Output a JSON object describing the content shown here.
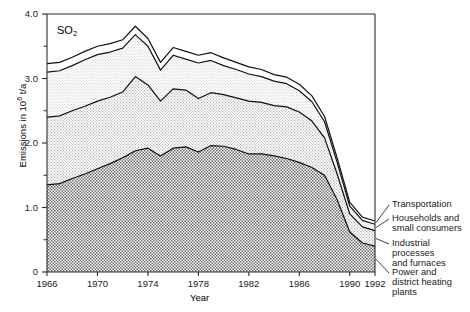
{
  "chart_data": {
    "type": "area",
    "title": "",
    "series_label": "SO2",
    "xlabel": "Year",
    "ylabel_prefix": "Emissions in 10",
    "ylabel_exp": "6",
    "ylabel_suffix": " t/a",
    "xlim": [
      1966,
      1992
    ],
    "ylim": [
      0,
      4.0
    ],
    "grid": false,
    "legend_position": "right-inline",
    "ytick_labels": [
      "4.0",
      "3.0",
      "2.0",
      "1.0",
      "0"
    ],
    "ytick_values": [
      4.0,
      3.0,
      2.0,
      1.0,
      0
    ],
    "yminor_values": [
      3.5,
      2.5,
      1.5,
      0.5
    ],
    "xtick_labels": [
      "1966",
      "1970",
      "1974",
      "1978",
      "1982",
      "1986",
      "1990",
      "1992"
    ],
    "xtick_values": [
      1966,
      1970,
      1974,
      1978,
      1982,
      1986,
      1990,
      1992
    ],
    "x": [
      1966,
      1967,
      1968,
      1969,
      1970,
      1971,
      1972,
      1973,
      1974,
      1975,
      1976,
      1977,
      1978,
      1979,
      1980,
      1981,
      1982,
      1983,
      1984,
      1985,
      1986,
      1987,
      1988,
      1989,
      1990,
      1991,
      1992
    ],
    "stack_order": "bottom-to-top",
    "series": [
      {
        "name": "Power and district heating plants",
        "key": "power",
        "fill": "dark-checker",
        "values": [
          1.35,
          1.37,
          1.45,
          1.52,
          1.6,
          1.68,
          1.77,
          1.88,
          1.92,
          1.8,
          1.92,
          1.94,
          1.86,
          1.96,
          1.95,
          1.9,
          1.83,
          1.83,
          1.8,
          1.76,
          1.7,
          1.62,
          1.5,
          1.12,
          0.62,
          0.45,
          0.4
        ]
      },
      {
        "name": "Industrial processes and furnaces",
        "key": "industry",
        "fill": "medium-dot",
        "values": [
          1.05,
          1.05,
          1.05,
          1.05,
          1.05,
          1.03,
          1.02,
          1.15,
          0.98,
          0.85,
          0.92,
          0.88,
          0.83,
          0.82,
          0.8,
          0.8,
          0.82,
          0.8,
          0.78,
          0.8,
          0.78,
          0.72,
          0.58,
          0.4,
          0.28,
          0.25,
          0.24
        ]
      },
      {
        "name": "Households and small consumers",
        "key": "households",
        "fill": "light-dot",
        "values": [
          0.7,
          0.7,
          0.7,
          0.72,
          0.72,
          0.7,
          0.68,
          0.65,
          0.6,
          0.48,
          0.52,
          0.48,
          0.55,
          0.5,
          0.45,
          0.44,
          0.42,
          0.4,
          0.38,
          0.36,
          0.33,
          0.3,
          0.25,
          0.18,
          0.12,
          0.1,
          0.1
        ]
      },
      {
        "name": "Transportation",
        "key": "transport",
        "fill": "white",
        "values": [
          0.13,
          0.13,
          0.13,
          0.13,
          0.13,
          0.13,
          0.13,
          0.13,
          0.12,
          0.12,
          0.12,
          0.12,
          0.12,
          0.12,
          0.12,
          0.11,
          0.11,
          0.11,
          0.1,
          0.1,
          0.1,
          0.09,
          0.08,
          0.07,
          0.06,
          0.05,
          0.05
        ]
      }
    ],
    "totals": [
      3.23,
      3.25,
      3.33,
      3.42,
      3.5,
      3.54,
      3.6,
      3.81,
      3.62,
      3.25,
      3.48,
      3.42,
      3.36,
      3.4,
      3.32,
      3.25,
      3.18,
      3.14,
      3.06,
      3.02,
      2.91,
      2.73,
      2.41,
      1.77,
      1.08,
      0.85,
      0.79
    ]
  },
  "legend": {
    "items": [
      {
        "label": "Transportation",
        "lines": [
          "Transportation"
        ]
      },
      {
        "label": "Households and small consumers",
        "lines": [
          "Households and",
          "small consumers"
        ]
      },
      {
        "label": "Industrial processes and furnaces",
        "lines": [
          "Industrial",
          "processes",
          "and furnaces"
        ]
      },
      {
        "label": "Power and district heating plants",
        "lines": [
          "Power and",
          "district  heating",
          "plants"
        ]
      }
    ]
  },
  "colors": {
    "axis": "#2b2b2b",
    "power": "#9a9a9a",
    "industry": "#c9c9c9",
    "households": "#e4e4e4",
    "transport": "#ffffff",
    "line": "#111111"
  }
}
